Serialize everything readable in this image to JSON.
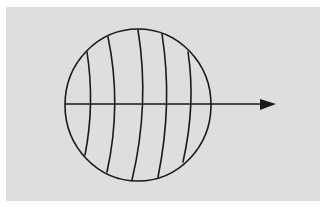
{
  "diagram": {
    "colors": {
      "background": "#ffffff",
      "panel": "#dedede",
      "ink": "#1a1a1a"
    },
    "circle": {
      "cx": 138,
      "cy": 105,
      "rx": 73,
      "ry": 76
    },
    "curved_lines": [
      {
        "d": "M87,52 Q95,104 85,155"
      },
      {
        "d": "M108,37 Q122,104 107,172"
      },
      {
        "d": "M138,30 Q150,104 132,180"
      },
      {
        "d": "M162,34 Q173,104 158,177"
      },
      {
        "d": "M188,52 Q196,104 183,162"
      }
    ],
    "arrow": {
      "x1": 65,
      "y1": 104,
      "x2": 262,
      "y2": 104,
      "head": "260,99 276,104 260,110",
      "direction": "right"
    }
  }
}
